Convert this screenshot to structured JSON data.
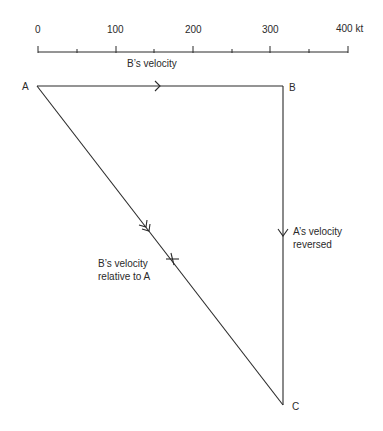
{
  "scale": {
    "tick_labels": [
      "0",
      "100",
      "200",
      "300",
      "400 kt"
    ],
    "caption": "B’s velocity",
    "unit": "kt"
  },
  "points": {
    "A": "A",
    "B": "B",
    "C": "C"
  },
  "labels": {
    "bc_line_1": "A’s velocity",
    "bc_line_2": "reversed",
    "ac_line_1": "B’s velocity",
    "ac_line_2": "relative to A"
  },
  "colors": {
    "ink": "#2a2a2a",
    "background": "#ffffff"
  }
}
